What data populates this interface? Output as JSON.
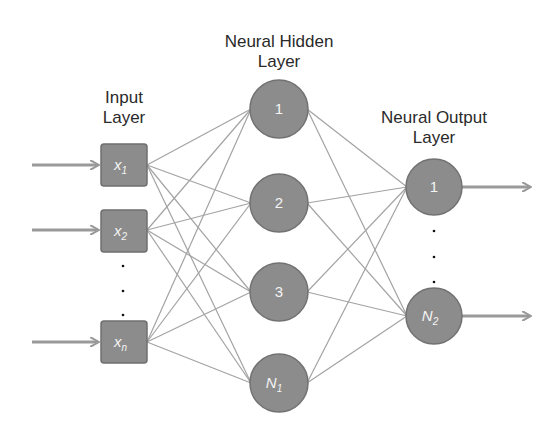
{
  "diagram": {
    "type": "neural-network",
    "colors": {
      "node_fill": "#8c8c8c",
      "node_stroke": "#6f6f6f",
      "edge": "#9e9e9e",
      "arrow": "#999999",
      "text": "#2a2a2a",
      "node_text": "#f4f4f4"
    },
    "layers": {
      "input": {
        "label_line1": "Input",
        "label_line2": "Layer",
        "nodes": [
          {
            "id": "x1",
            "base": "x",
            "sub": "1"
          },
          {
            "id": "x2",
            "base": "x",
            "sub": "2"
          },
          {
            "id": "xn",
            "base": "x",
            "sub": "n"
          }
        ],
        "ellipsis": "⋮"
      },
      "hidden": {
        "label_line1": "Neural Hidden",
        "label_line2": "Layer",
        "nodes": [
          {
            "id": "h1",
            "base": "1",
            "sub": ""
          },
          {
            "id": "h2",
            "base": "2",
            "sub": ""
          },
          {
            "id": "h3",
            "base": "3",
            "sub": ""
          },
          {
            "id": "hN1",
            "base": "N",
            "sub": "1"
          }
        ]
      },
      "output": {
        "label_line1": "Neural Output",
        "label_line2": "Layer",
        "nodes": [
          {
            "id": "o1",
            "base": "1",
            "sub": ""
          },
          {
            "id": "oN2",
            "base": "N",
            "sub": "2"
          }
        ],
        "ellipsis": "⋮"
      }
    },
    "connections": "fully-connected input→hidden and hidden→output"
  }
}
